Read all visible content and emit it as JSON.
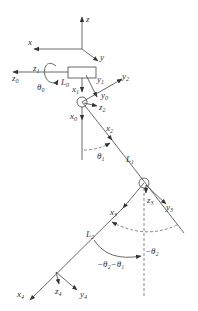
{
  "diagram": {
    "type": "robot-arm-kinematics",
    "base_frame": {
      "x": "x",
      "y": "y",
      "z": "z"
    },
    "labels": {
      "z1": {
        "base": "z",
        "sub": "1"
      },
      "z0": {
        "base": "z",
        "sub": "0"
      },
      "theta0": {
        "base": "θ",
        "sub": "0"
      },
      "L0": {
        "base": "L",
        "sub": "0"
      },
      "x1": {
        "base": "x",
        "sub": "1"
      },
      "y1": {
        "base": "y",
        "sub": "1"
      },
      "y2": {
        "base": "y",
        "sub": "2"
      },
      "y0": {
        "base": "y",
        "sub": "0"
      },
      "z2": {
        "base": "z",
        "sub": "2"
      },
      "x0": {
        "base": "x",
        "sub": "0"
      },
      "x2": {
        "base": "x",
        "sub": "2"
      },
      "theta1": {
        "base": "θ",
        "sub": "1"
      },
      "L1": {
        "base": "L",
        "sub": "1"
      },
      "x3": {
        "base": "x",
        "sub": "3"
      },
      "z3": {
        "base": "z",
        "sub": "3"
      },
      "y3": {
        "base": "y",
        "sub": "3"
      },
      "L2": {
        "base": "L",
        "sub": "2"
      },
      "neg_theta2": "−θ₂",
      "neg_theta2_minus_theta1": "−θ₂−θ₁",
      "x4": {
        "base": "x",
        "sub": "4"
      },
      "z4": {
        "base": "z",
        "sub": "4"
      },
      "y4": {
        "base": "y",
        "sub": "4"
      }
    }
  }
}
